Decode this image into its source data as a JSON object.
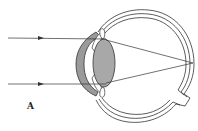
{
  "figure": {
    "condition_depicted": "focal point behind retina",
    "panel_label": "A",
    "colors": {
      "line": "#333333",
      "cornea_fill": "#9a9a9a",
      "lens_fill": "#a8a8a8",
      "background": "#ffffff"
    },
    "rays": [
      {
        "name": "upper-ray"
      },
      {
        "name": "lower-ray"
      }
    ]
  }
}
